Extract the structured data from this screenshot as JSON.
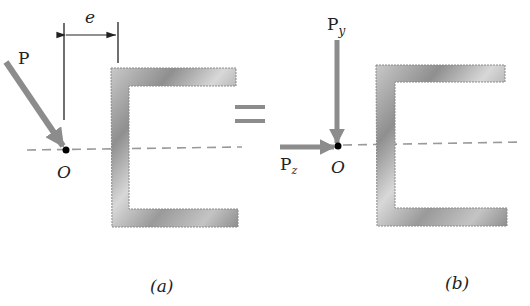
{
  "figure": {
    "panel_a": {
      "caption": "(a)",
      "force_label": "P",
      "point_label": "O",
      "dimension_label": "e"
    },
    "equals_sign": "=",
    "panel_b": {
      "caption": "(b)",
      "force_y_label": "P",
      "force_y_subscript": "y",
      "force_z_label": "P",
      "force_z_subscript": "z",
      "point_label": "O"
    },
    "colors": {
      "channel_fill": "#a9a9a9",
      "channel_edge": "#8a8a8a",
      "arrow": "#8c8c8c",
      "dashed_line": "#9a9a9a",
      "ink": "#222222"
    }
  }
}
